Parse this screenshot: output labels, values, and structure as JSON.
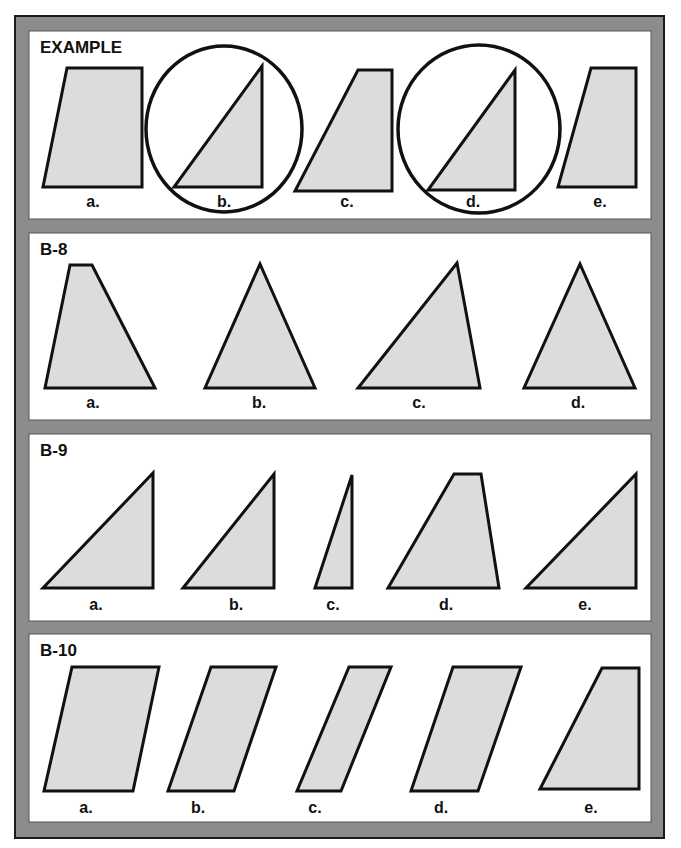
{
  "style": {
    "frame_color": "#8c8c8c",
    "frame_border": "#1a1a1a",
    "panel_bg": "#ffffff",
    "shape_fill": "#dcdcdc",
    "shape_stroke": "#111111"
  },
  "panels": [
    {
      "title": "EXAMPLE",
      "box": [
        29,
        31,
        622,
        188
      ],
      "title_pos": [
        40,
        38
      ],
      "circles": [
        {
          "cx": 224,
          "cy": 129,
          "rx": 78,
          "ry": 83
        },
        {
          "cx": 479,
          "cy": 129,
          "rx": 81,
          "ry": 84
        }
      ],
      "shapes": [
        {
          "label": "a.",
          "label_pos": [
            93,
            193
          ],
          "points": [
            [
              67,
              68
            ],
            [
              142,
              68
            ],
            [
              142,
              187
            ],
            [
              43,
              187
            ]
          ]
        },
        {
          "label": "b.",
          "label_pos": [
            224,
            193
          ],
          "points": [
            [
              262,
              66
            ],
            [
              262,
              187
            ],
            [
              174,
              187
            ]
          ]
        },
        {
          "label": "c.",
          "label_pos": [
            347,
            193
          ],
          "points": [
            [
              358,
              70
            ],
            [
              392,
              70
            ],
            [
              392,
              191
            ],
            [
              295,
              191
            ]
          ]
        },
        {
          "label": "d.",
          "label_pos": [
            473,
            193
          ],
          "points": [
            [
              515,
              70
            ],
            [
              515,
              190
            ],
            [
              428,
              190
            ]
          ]
        },
        {
          "label": "e.",
          "label_pos": [
            600,
            193
          ],
          "points": [
            [
              591,
              68
            ],
            [
              636,
              68
            ],
            [
              636,
              187
            ],
            [
              558,
              187
            ]
          ]
        }
      ]
    },
    {
      "title": "B-8",
      "box": [
        29,
        233,
        622,
        187
      ],
      "title_pos": [
        40,
        240
      ],
      "circles": [],
      "shapes": [
        {
          "label": "a.",
          "label_pos": [
            93,
            394
          ],
          "points": [
            [
              70,
              265
            ],
            [
              92,
              265
            ],
            [
              155,
              388
            ],
            [
              45,
              388
            ]
          ]
        },
        {
          "label": "b.",
          "label_pos": [
            259,
            394
          ],
          "points": [
            [
              260,
              264
            ],
            [
              315,
              388
            ],
            [
              205,
              388
            ]
          ]
        },
        {
          "label": "c.",
          "label_pos": [
            419,
            394
          ],
          "points": [
            [
              457,
              263
            ],
            [
              480,
              388
            ],
            [
              358,
              388
            ]
          ]
        },
        {
          "label": "d.",
          "label_pos": [
            578,
            394
          ],
          "points": [
            [
              580,
              264
            ],
            [
              635,
              388
            ],
            [
              524,
              388
            ]
          ]
        }
      ]
    },
    {
      "title": "B-9",
      "box": [
        29,
        434,
        622,
        187
      ],
      "title_pos": [
        40,
        441
      ],
      "circles": [],
      "shapes": [
        {
          "label": "a.",
          "label_pos": [
            96,
            596
          ],
          "points": [
            [
              153,
              473
            ],
            [
              153,
              588
            ],
            [
              43,
              588
            ]
          ]
        },
        {
          "label": "b.",
          "label_pos": [
            236,
            596
          ],
          "points": [
            [
              274,
              474
            ],
            [
              274,
              588
            ],
            [
              183,
              588
            ]
          ]
        },
        {
          "label": "c.",
          "label_pos": [
            333,
            596
          ],
          "points": [
            [
              352,
              475
            ],
            [
              352,
              588
            ],
            [
              315,
              588
            ]
          ]
        },
        {
          "label": "d.",
          "label_pos": [
            446,
            596
          ],
          "points": [
            [
              454,
              474
            ],
            [
              481,
              474
            ],
            [
              499,
              588
            ],
            [
              388,
              588
            ]
          ]
        },
        {
          "label": "e.",
          "label_pos": [
            585,
            596
          ],
          "points": [
            [
              636,
              474
            ],
            [
              636,
              588
            ],
            [
              526,
              588
            ]
          ]
        }
      ]
    },
    {
      "title": "B-10",
      "box": [
        29,
        634,
        622,
        188
      ],
      "title_pos": [
        40,
        641
      ],
      "circles": [],
      "shapes": [
        {
          "label": "a.",
          "label_pos": [
            86,
            799
          ],
          "points": [
            [
              72,
              667
            ],
            [
              159,
              667
            ],
            [
              133,
              791
            ],
            [
              44,
              791
            ]
          ]
        },
        {
          "label": "b.",
          "label_pos": [
            198,
            799
          ],
          "points": [
            [
              211,
              667
            ],
            [
              276,
              667
            ],
            [
              234,
              791
            ],
            [
              168,
              791
            ]
          ]
        },
        {
          "label": "c.",
          "label_pos": [
            315,
            799
          ],
          "points": [
            [
              349,
              667
            ],
            [
              391,
              667
            ],
            [
              341,
              791
            ],
            [
              297,
              791
            ]
          ]
        },
        {
          "label": "d.",
          "label_pos": [
            441,
            799
          ],
          "points": [
            [
              453,
              667
            ],
            [
              521,
              667
            ],
            [
              478,
              791
            ],
            [
              411,
              791
            ]
          ]
        },
        {
          "label": "e.",
          "label_pos": [
            591,
            799
          ],
          "points": [
            [
              602,
              668
            ],
            [
              639,
              668
            ],
            [
              639,
              789
            ],
            [
              540,
              789
            ]
          ]
        }
      ]
    }
  ]
}
